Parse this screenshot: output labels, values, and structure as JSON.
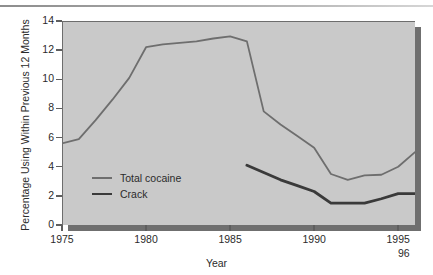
{
  "chart_data": {
    "type": "line",
    "title": "",
    "xlabel": "Year",
    "ylabel": "Percentage Using Within Previous 12 Months",
    "xlim": [
      1975,
      1996
    ],
    "ylim": [
      0,
      14
    ],
    "xticks": [
      1975,
      1980,
      1985,
      1990,
      1995
    ],
    "xtick_labels": [
      "1975",
      "1980",
      "1985",
      "1990",
      "1995"
    ],
    "extra_xtick_label": "96",
    "yticks": [
      0,
      2,
      4,
      6,
      8,
      10,
      12,
      14
    ],
    "ytick_labels": [
      "0",
      "2",
      "4",
      "6",
      "8",
      "10",
      "12",
      "14"
    ],
    "grid": false,
    "legend_position": "inside-lower-left",
    "series": [
      {
        "name": "Total cocaine",
        "color": "#6e6e6e",
        "x": [
          1975,
          1976,
          1977,
          1978,
          1979,
          1980,
          1981,
          1982,
          1983,
          1984,
          1985,
          1986,
          1987,
          1988,
          1989,
          1990,
          1991,
          1992,
          1993,
          1994,
          1995,
          1996
        ],
        "values": [
          5.6,
          5.9,
          7.2,
          8.6,
          10.1,
          12.2,
          12.4,
          12.5,
          12.6,
          12.8,
          12.95,
          12.6,
          7.8,
          6.9,
          6.1,
          5.3,
          3.5,
          3.1,
          3.4,
          3.45,
          4.0,
          5.0
        ]
      },
      {
        "name": "Crack",
        "color": "#3a3a3a",
        "x": [
          1986,
          1987,
          1988,
          1989,
          1990,
          1991,
          1992,
          1993,
          1994,
          1995,
          1996
        ],
        "values": [
          4.1,
          3.6,
          3.1,
          2.7,
          2.3,
          1.5,
          1.5,
          1.5,
          1.8,
          2.15,
          2.15
        ]
      }
    ]
  },
  "legend": {
    "items": [
      {
        "label": "Total cocaine"
      },
      {
        "label": "Crack"
      }
    ]
  },
  "colors": {
    "panel_background": "#c9c9c9",
    "panel_shadow": "#6f6f6f",
    "axis": "#5e5e5e",
    "text": "#2b2b2b",
    "series_cocaine": "#6e6e6e",
    "series_crack": "#3a3a3a"
  }
}
